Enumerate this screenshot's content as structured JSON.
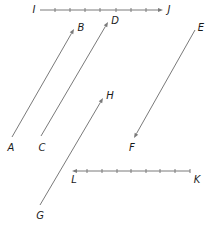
{
  "diagram": {
    "type": "vectors",
    "line_color": "#7a7a7a",
    "label_color": "#1a1a1a",
    "vectors": [
      {
        "name": "IJ",
        "tail": "I",
        "head": "J",
        "from": [
          40,
          10
        ],
        "to": [
          163,
          10
        ],
        "ticked": true,
        "ticks_x": [
          55,
          70,
          85,
          100,
          116,
          131,
          146
        ]
      },
      {
        "name": "AB",
        "tail": "A",
        "head": "B",
        "from": [
          12,
          137
        ],
        "to": [
          74,
          29
        ],
        "ticked": false
      },
      {
        "name": "CD",
        "tail": "C",
        "head": "D",
        "from": [
          41,
          136
        ],
        "to": [
          108,
          22
        ],
        "ticked": false
      },
      {
        "name": "EF",
        "tail": "E",
        "head": "F",
        "from": [
          195,
          30
        ],
        "to": [
          134,
          138
        ],
        "ticked": false
      },
      {
        "name": "GH",
        "tail": "G",
        "head": "H",
        "from": [
          40,
          205
        ],
        "to": [
          103,
          98
        ],
        "ticked": false
      },
      {
        "name": "KL",
        "tail": "K",
        "head": "L",
        "from": [
          190,
          171
        ],
        "to": [
          72,
          171
        ],
        "ticked": true,
        "ticks_x": [
          87,
          102,
          117,
          131,
          146,
          160,
          175,
          190
        ]
      }
    ],
    "labels": {
      "I": {
        "text": "I",
        "x": 34,
        "y": 10
      },
      "J": {
        "text": "J",
        "x": 169,
        "y": 10
      },
      "A": {
        "text": "A",
        "x": 11,
        "y": 148
      },
      "B": {
        "text": "B",
        "x": 81,
        "y": 28
      },
      "C": {
        "text": "C",
        "x": 42,
        "y": 148
      },
      "D": {
        "text": "D",
        "x": 115,
        "y": 21
      },
      "E": {
        "text": "E",
        "x": 201,
        "y": 28
      },
      "F": {
        "text": "F",
        "x": 132,
        "y": 148
      },
      "G": {
        "text": "G",
        "x": 40,
        "y": 216
      },
      "H": {
        "text": "H",
        "x": 110,
        "y": 96
      },
      "K": {
        "text": "K",
        "x": 197,
        "y": 180
      },
      "L": {
        "text": "L",
        "x": 74,
        "y": 180
      }
    }
  }
}
